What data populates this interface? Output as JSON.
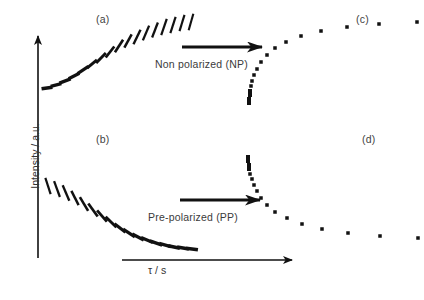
{
  "figure": {
    "background_color": "#ffffff",
    "ink_color": "#111111",
    "text_color": "#3b3b3b"
  },
  "axes": {
    "y_label": "Intensity / a.u.",
    "x_label": "τ / s",
    "y_axis": {
      "x": 38,
      "y_top": 36,
      "y_bottom": 258,
      "arrow": "up"
    },
    "x_axis": {
      "y": 260,
      "x_left": 122,
      "x_right": 292,
      "arrow": "right"
    }
  },
  "panel_labels": [
    {
      "key": "a",
      "text": "(a)",
      "x": 96,
      "y": 13
    },
    {
      "key": "b",
      "text": "(b)",
      "x": 96,
      "y": 133
    },
    {
      "key": "c",
      "text": "(c)",
      "x": 356,
      "y": 13
    },
    {
      "key": "d",
      "text": "(d)",
      "x": 362,
      "y": 133
    }
  ],
  "annotations": [
    {
      "name": "non-polarized",
      "text": "Non polarized (NP)",
      "x": 155,
      "y": 58,
      "arrow": {
        "x1": 182,
        "y1": 47,
        "x2": 262,
        "y2": 47
      }
    },
    {
      "name": "pre-polarized",
      "text": "Pre-polarized (PP)",
      "x": 148,
      "y": 211,
      "arrow": {
        "x1": 180,
        "y1": 200,
        "x2": 260,
        "y2": 200
      }
    }
  ],
  "chart_data": {
    "type": "scatter",
    "xlabel": "τ / s",
    "ylabel": "Intensity / a.u.",
    "grid": false,
    "legend": "none",
    "panels": [
      {
        "key": "a",
        "label": "(a)",
        "description": "Non-polarized raw signal traces: short strokes whose tilt rotates from near-horizontal to near-vertical along a rising saturation-recovery envelope",
        "marker": "tilted-stroke",
        "x": [
          47,
          56,
          65,
          74,
          83,
          92,
          101,
          110,
          119,
          128,
          137,
          146,
          155,
          164,
          173,
          182,
          191
        ],
        "y": [
          88,
          85,
          81,
          76,
          70,
          64,
          58,
          52,
          46,
          41,
          37,
          33,
          30,
          27,
          25,
          23,
          22
        ],
        "stroke_angle_deg": [
          8,
          14,
          20,
          27,
          33,
          40,
          46,
          52,
          57,
          61,
          64,
          67,
          69,
          71,
          72,
          73,
          74
        ],
        "stroke_length": [
          11,
          11,
          12,
          12,
          13,
          13,
          14,
          14,
          15,
          15,
          16,
          16,
          16,
          17,
          17,
          17,
          17
        ]
      },
      {
        "key": "b",
        "label": "(b)",
        "description": "Pre-polarized raw signal traces: short strokes rotating from near-vertical to near-horizontal along a decaying envelope",
        "marker": "tilted-stroke",
        "x": [
          48,
          57,
          66,
          75,
          84,
          93,
          102,
          111,
          120,
          129,
          138,
          147,
          156,
          165,
          174,
          183,
          192
        ],
        "y": [
          186,
          189,
          193,
          198,
          204,
          210,
          216,
          222,
          228,
          233,
          237,
          240,
          243,
          245,
          247,
          248,
          249
        ],
        "stroke_angle_deg": [
          72,
          70,
          67,
          63,
          59,
          54,
          49,
          44,
          38,
          33,
          28,
          23,
          19,
          15,
          12,
          10,
          8
        ],
        "stroke_length": [
          17,
          17,
          17,
          16,
          16,
          16,
          15,
          15,
          14,
          14,
          13,
          13,
          13,
          12,
          12,
          12,
          12
        ]
      },
      {
        "key": "c",
        "label": "(c)",
        "description": "Non-polarized build-up curve: intensity grows with τ and saturates; points are log-spaced in τ",
        "marker": "square",
        "x": [
          249,
          249,
          250,
          250,
          251,
          252,
          254,
          257,
          261,
          267,
          275,
          286,
          301,
          321,
          347,
          379,
          417
        ],
        "y": [
          103,
          99,
          95,
          91,
          86,
          81,
          75,
          69,
          62,
          55,
          48,
          42,
          36,
          31,
          27,
          24,
          22
        ],
        "marker_sizes": [
          4,
          4,
          4,
          4,
          3.5,
          3.5,
          3.5,
          3.5,
          3.5,
          3.5,
          3.5,
          3.5,
          3.5,
          3.5,
          3.5,
          3.5,
          3.5
        ]
      },
      {
        "key": "d",
        "label": "(d)",
        "description": "Pre-polarized decay curve: intensity falls with τ toward a plateau; points are log-spaced in τ",
        "marker": "square",
        "x": [
          248,
          248,
          249,
          249,
          250,
          252,
          254,
          257,
          261,
          267,
          275,
          287,
          302,
          322,
          348,
          380,
          418
        ],
        "y": [
          157,
          161,
          165,
          169,
          174,
          179,
          185,
          191,
          198,
          205,
          212,
          218,
          224,
          229,
          233,
          236,
          238
        ],
        "marker_sizes": [
          4,
          4,
          4,
          4,
          3.5,
          3.5,
          3.5,
          3.5,
          3.5,
          3.5,
          3.5,
          3.5,
          3.5,
          3.5,
          3.5,
          3.5,
          3.5
        ]
      }
    ]
  }
}
